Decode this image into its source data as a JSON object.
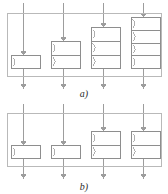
{
  "figure": {
    "title_fragment": "",
    "width": 168,
    "height": 194,
    "background": "#ffffff",
    "line_color": "#9d9d9d",
    "box_stroke": "#8e8e8e",
    "frame_stroke": "#b9b9b9",
    "caption_color": "#2b2b2b"
  },
  "panels": [
    {
      "id": "panel-a",
      "label": "a)",
      "label_x": 84,
      "label_y": 95,
      "frame": {
        "x": 7,
        "y": 13,
        "w": 155,
        "h": 64
      },
      "boxes": [
        {
          "id": "box-a1",
          "cells": 1,
          "x": 11,
          "y": 55,
          "w": 30,
          "h": 14,
          "cell_h": 14
        },
        {
          "id": "box-a2",
          "cells": 2,
          "x": 51,
          "y": 41,
          "w": 30,
          "h": 28,
          "cell_h": 14
        },
        {
          "id": "box-a3",
          "cells": 3,
          "x": 91,
          "y": 27,
          "w": 30,
          "h": 42,
          "cell_h": 14
        },
        {
          "id": "box-a4",
          "cells": 4,
          "x": 131,
          "y": 17,
          "w": 30,
          "h": 52,
          "cell_h": 13
        }
      ],
      "flows": [
        {
          "id": "flow-a1",
          "x": 23,
          "top": 3,
          "bottom": 88,
          "box_top": 55,
          "box_bottom": 69
        },
        {
          "id": "flow-a2",
          "x": 63,
          "top": 3,
          "bottom": 88,
          "box_top": 41,
          "box_bottom": 69
        },
        {
          "id": "flow-a3",
          "x": 103,
          "top": 3,
          "bottom": 88,
          "box_top": 27,
          "box_bottom": 69
        },
        {
          "id": "flow-a4",
          "x": 143,
          "top": 3,
          "bottom": 88,
          "box_top": 17,
          "box_bottom": 69
        }
      ]
    },
    {
      "id": "panel-b",
      "label": "b)",
      "label_x": 84,
      "label_y": 188,
      "frame": {
        "x": 7,
        "y": 113,
        "w": 155,
        "h": 54
      },
      "boxes": [
        {
          "id": "box-b1",
          "cells": 1,
          "x": 11,
          "y": 145,
          "w": 30,
          "h": 14,
          "cell_h": 14
        },
        {
          "id": "box-b2",
          "cells": 1,
          "x": 51,
          "y": 145,
          "w": 30,
          "h": 14,
          "cell_h": 14
        },
        {
          "id": "box-b3",
          "cells": 2,
          "x": 91,
          "y": 131,
          "w": 30,
          "h": 28,
          "cell_h": 14
        },
        {
          "id": "box-b4",
          "cells": 2,
          "x": 131,
          "y": 131,
          "w": 30,
          "h": 28,
          "cell_h": 14
        }
      ],
      "flows": [
        {
          "id": "flow-b1",
          "x": 23,
          "top": 104,
          "bottom": 178,
          "box_top": 145,
          "box_bottom": 159
        },
        {
          "id": "flow-b2",
          "x": 63,
          "top": 104,
          "bottom": 178,
          "box_top": 145,
          "box_bottom": 159
        },
        {
          "id": "flow-b3",
          "x": 103,
          "top": 104,
          "bottom": 178,
          "box_top": 131,
          "box_bottom": 159
        },
        {
          "id": "flow-b4",
          "x": 143,
          "top": 104,
          "bottom": 178,
          "box_top": 131,
          "box_bottom": 159
        }
      ]
    }
  ],
  "legend": {
    "cell_glyph": "queue-arc-icon",
    "arrow_glyph": "down-arrow-icon"
  }
}
